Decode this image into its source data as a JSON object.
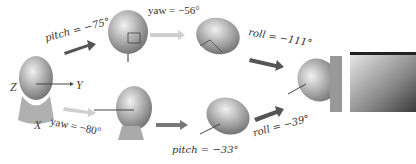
{
  "diagram": {
    "axes": {
      "z": "Z",
      "y": "Y",
      "x": "X"
    },
    "top_path": [
      {
        "label": "pitch = −75°"
      },
      {
        "label": "yaw = −56°"
      },
      {
        "label": "roll = −111°"
      }
    ],
    "bottom_path": [
      {
        "label": "yaw = −80°"
      },
      {
        "label": "pitch = −33°"
      },
      {
        "label": "roll = −39°"
      }
    ]
  },
  "colors": {
    "arrow": "#555555",
    "arrow_light": "#c8c8c8",
    "head_fill": "#bdbdbd",
    "background": "#ffffff"
  }
}
